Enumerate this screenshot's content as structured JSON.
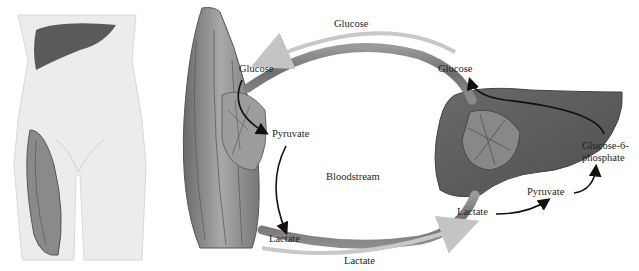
{
  "body_figure": {
    "organs_shown": [
      "liver",
      "thigh-muscle"
    ]
  },
  "labels": {
    "glucose_top": "Glucose",
    "glucose_muscle": "Glucose",
    "glucose_liver": "Glucose",
    "pyruvate_muscle": "Pyruvate",
    "lactate_muscle": "Lactate",
    "lactate_bottom": "Lactate",
    "bloodstream": "Bloodstream",
    "lactate_liver": "Lactate",
    "pyruvate_liver": "Pyruvate",
    "g6p_line1": "Glucose-6-",
    "g6p_line2": "phosphate"
  },
  "colors": {
    "skin": "#ececec",
    "organ_dark": "#5e5e5e",
    "muscle": "#8a8a8a",
    "vessel": "#7d7d7d",
    "flow_arrow": "#c8c8c8",
    "reaction_arrow": "#111111"
  }
}
